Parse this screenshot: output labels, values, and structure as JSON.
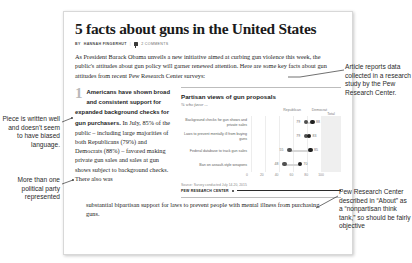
{
  "article": {
    "headline": "5 facts about guns in the United States",
    "byline_prefix": "BY",
    "byline_author": "HANNAH FINGERHUT",
    "byline_separator": "|",
    "comments": "2 COMMENTS",
    "lede": "As President Barack Obama unveils a new initiative aimed at curbing gun violence this week, the public's attitudes about gun policy will garner renewed attention. Here are some key facts about gun attitudes from recent Pew Research Center surveys:",
    "item_number": "1",
    "item_lead": "Americans have shown broad and consistent support for expanded background checks for gun purchasers.",
    "item_body": " In July, 85% of the public – including large majorities of both Republicans (79%) and Democrats (88%) – favored making private gun sales and sales at gun shows subject to background checks. There also was",
    "item_tail": "substantial bipartisan support for laws to prevent people with mental illness from purchasing guns."
  },
  "chart_data": {
    "type": "bar",
    "title": "Partisan views of gun proposals",
    "subtitle": "% who favor ...",
    "xlabel": "",
    "ylabel": "",
    "xlim": [
      0,
      100
    ],
    "xticks": [
      "0",
      "20",
      "40",
      "60",
      "80",
      "100"
    ],
    "grid": true,
    "legend_position": "top-right",
    "total_header": "Total",
    "categories": [
      "Background checks for gun shows and private sales",
      "Laws to prevent mentally ill from buying guns",
      "Federal database to track gun sales",
      "Ban on assault-style weapons"
    ],
    "series": [
      {
        "name": "Republican",
        "values": [
          79,
          79,
          55,
          48
        ]
      },
      {
        "name": "Democrat",
        "values": [
          88,
          83,
          85,
          70
        ]
      }
    ],
    "totals": [
      "85%",
      "79",
      "70",
      "57"
    ],
    "source": "Source: Survey conducted July 14-20, 2015",
    "org": "PEW RESEARCH CENTER"
  },
  "annotations": {
    "left_top": "Piece is written well and doesn't seem to have biased language.",
    "left_bottom": "More than one political party represented",
    "right_top": "Article reports data collected in a research study by the Pew Research Center.",
    "right_bottom": "Pew Research Center described in “About” as a “nonpartisan think tank,” so should be fairly objective"
  }
}
